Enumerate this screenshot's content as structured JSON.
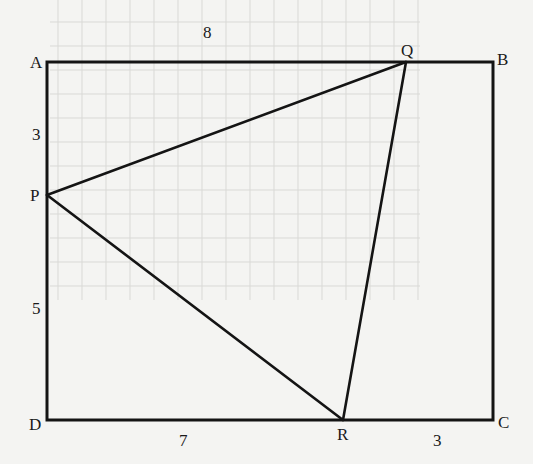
{
  "figure": {
    "rectangle": {
      "vertices": {
        "A": {
          "label": "A",
          "x": 47,
          "y": 62
        },
        "B": {
          "label": "B",
          "x": 493,
          "y": 62
        },
        "C": {
          "label": "C",
          "x": 493,
          "y": 420
        },
        "D": {
          "label": "D",
          "x": 47,
          "y": 420
        }
      }
    },
    "triangle": {
      "vertices": {
        "P": {
          "label": "P",
          "x": 47,
          "y": 195
        },
        "Q": {
          "label": "Q",
          "x": 406,
          "y": 62
        },
        "R": {
          "label": "R",
          "x": 343,
          "y": 420
        }
      }
    },
    "measurements": {
      "AQ": {
        "value": "8",
        "x": 203,
        "y": 24
      },
      "AP": {
        "value": "3",
        "x": 32,
        "y": 126
      },
      "PD": {
        "value": "5",
        "x": 32,
        "y": 300
      },
      "DR": {
        "value": "7",
        "x": 179,
        "y": 432
      },
      "RC": {
        "value": "3",
        "x": 433,
        "y": 432
      }
    },
    "label_positions": {
      "A": {
        "x": 30,
        "y": 54
      },
      "B": {
        "x": 497,
        "y": 51
      },
      "C": {
        "x": 498,
        "y": 414
      },
      "D": {
        "x": 29,
        "y": 416
      },
      "P": {
        "x": 30,
        "y": 187
      },
      "Q": {
        "x": 401,
        "y": 42
      },
      "R": {
        "x": 337,
        "y": 426
      }
    },
    "colors": {
      "line": "#141414",
      "label": "#1a1a1a",
      "paper": "#f4f4f2",
      "grid": "#d9d9d6"
    }
  }
}
